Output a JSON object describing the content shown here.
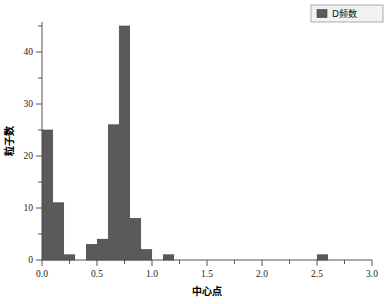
{
  "chart_data": {
    "type": "bar",
    "title": "",
    "subtitle": "",
    "xlabel": "中心点",
    "ylabel": "粒子数",
    "xlim": [
      0.0,
      3.0
    ],
    "ylim": [
      0,
      47
    ],
    "xticks": [
      "0.0",
      "0.5",
      "1.0",
      "1.5",
      "2.0",
      "2.5",
      "3.0"
    ],
    "xtick_values": [
      0.0,
      0.5,
      1.0,
      1.5,
      2.0,
      2.5,
      3.0
    ],
    "yticks": [
      "0",
      "10",
      "20",
      "30",
      "40"
    ],
    "ytick_values": [
      0,
      10,
      20,
      30,
      40
    ],
    "grid": false,
    "legend_position": "top-right",
    "bin_width": 0.095,
    "bar_color": "#5a5a5a",
    "bar_edge_color": "#3d3d3d",
    "series": [
      {
        "name": "D频数",
        "x": [
          0.05,
          0.15,
          0.25,
          0.45,
          0.55,
          0.65,
          0.75,
          0.85,
          0.95,
          1.15,
          2.55
        ],
        "values": [
          25,
          11,
          1,
          3,
          4,
          26,
          45,
          8,
          2,
          1,
          1
        ]
      }
    ],
    "categories": [
      "0.05",
      "0.15",
      "0.25",
      "0.45",
      "0.55",
      "0.65",
      "0.75",
      "0.85",
      "0.95",
      "1.15",
      "2.55"
    ],
    "values": [
      25,
      11,
      1,
      3,
      4,
      26,
      45,
      8,
      2,
      1,
      1
    ]
  },
  "legend": {
    "entries": [
      {
        "label": "D频数",
        "color": "#5a5a5a"
      }
    ]
  }
}
